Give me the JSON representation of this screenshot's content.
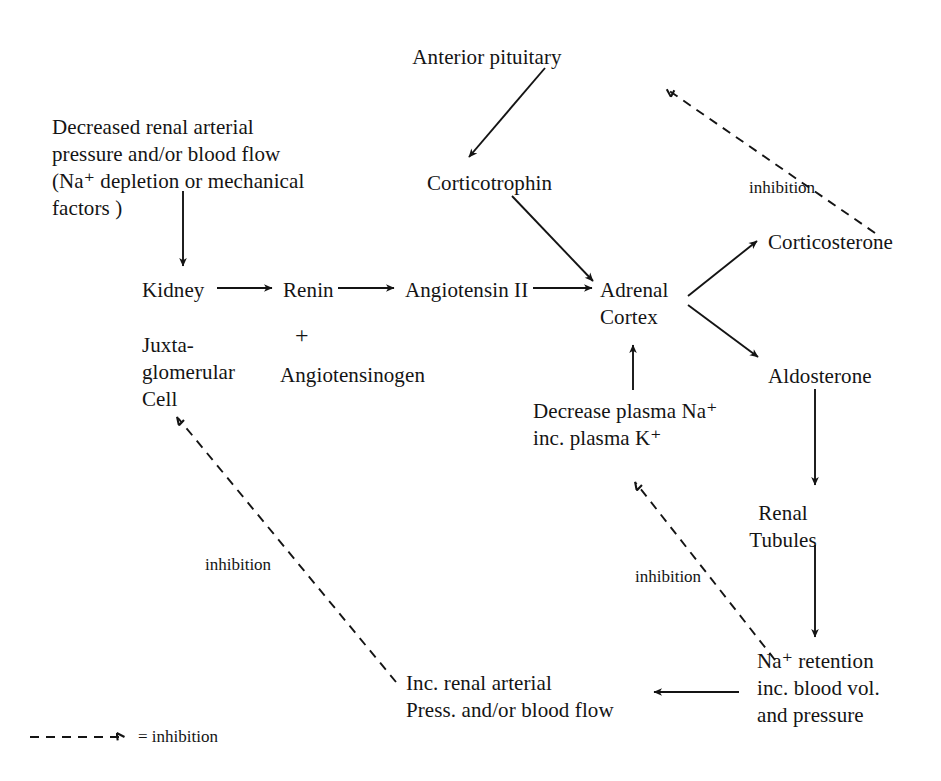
{
  "diagram": {
    "title_present": false,
    "background_color": "#ffffff",
    "line_color": "#141414",
    "nodes": [
      {
        "id": "anterior_pituitary",
        "label": "Anterior pituitary",
        "x": 487,
        "y": 44,
        "align": "center"
      },
      {
        "id": "corticotrophin",
        "label": "Corticotrophin",
        "x": 427,
        "y": 170,
        "align": "left"
      },
      {
        "id": "decreased_renal",
        "label": "Decreased renal arterial\npressure and/or blood flow\n(Na⁺ depletion or mechanical\nfactors )",
        "x": 52,
        "y": 114,
        "align": "left"
      },
      {
        "id": "kidney",
        "label": "Kidney",
        "x": 142,
        "y": 277,
        "align": "left"
      },
      {
        "id": "renin",
        "label": "Renin",
        "x": 283,
        "y": 277,
        "align": "left"
      },
      {
        "id": "angiotensin_ii",
        "label": "Angiotensin II",
        "x": 405,
        "y": 277,
        "align": "left"
      },
      {
        "id": "adrenal_cortex",
        "label": "Adrenal\nCortex",
        "x": 600,
        "y": 277,
        "align": "left"
      },
      {
        "id": "juxtaglomerular_cell",
        "label": "Juxta-\nglomerular\nCell",
        "x": 142,
        "y": 332,
        "align": "left"
      },
      {
        "id": "angiotensinogen",
        "label": "Angiotensinogen",
        "x": 280,
        "y": 362,
        "align": "left"
      },
      {
        "id": "plus_sign",
        "label": "+",
        "x": 295,
        "y": 326
      },
      {
        "id": "corticosterone",
        "label": "Corticosterone",
        "x": 768,
        "y": 229,
        "align": "left"
      },
      {
        "id": "aldosterone",
        "label": "Aldosterone",
        "x": 768,
        "y": 363,
        "align": "left"
      },
      {
        "id": "decrease_plasma",
        "label": "Decrease plasma Na⁺\ninc. plasma K⁺",
        "x": 533,
        "y": 398,
        "align": "left"
      },
      {
        "id": "renal_tubules",
        "label": "Renal\nTubules",
        "x": 783,
        "y": 500,
        "align": "center"
      },
      {
        "id": "na_retention",
        "label": "Na⁺ retention\ninc. blood vol.\nand pressure",
        "x": 757,
        "y": 648,
        "align": "left"
      },
      {
        "id": "inc_renal_arterial",
        "label": "Inc. renal arterial\nPress. and/or blood flow",
        "x": 406,
        "y": 670,
        "align": "left"
      }
    ],
    "edge_labels": [
      {
        "id": "inhibition_top_right",
        "label": "inhibition",
        "x": 749,
        "y": 178
      },
      {
        "id": "inhibition_left",
        "label": "inhibition",
        "x": 205,
        "y": 555
      },
      {
        "id": "inhibition_middle",
        "label": "inhibition",
        "x": 635,
        "y": 567
      }
    ],
    "legend": {
      "symbol": "dashed-arrow",
      "text": "= inhibition",
      "x": 30,
      "y": 731
    },
    "edges": [
      {
        "from": "anterior_pituitary",
        "to": "corticotrophin",
        "style": "solid"
      },
      {
        "from": "corticotrophin",
        "to": "adrenal_cortex",
        "style": "solid"
      },
      {
        "from": "decreased_renal",
        "to": "kidney",
        "style": "solid"
      },
      {
        "from": "kidney",
        "to": "renin",
        "style": "solid"
      },
      {
        "from": "renin",
        "to": "angiotensin_ii",
        "style": "solid"
      },
      {
        "from": "angiotensin_ii",
        "to": "adrenal_cortex",
        "style": "solid"
      },
      {
        "from": "adrenal_cortex",
        "to": "corticosterone",
        "style": "solid"
      },
      {
        "from": "adrenal_cortex",
        "to": "aldosterone",
        "style": "solid"
      },
      {
        "from": "decrease_plasma",
        "to": "adrenal_cortex",
        "style": "solid"
      },
      {
        "from": "aldosterone",
        "to": "renal_tubules",
        "style": "solid"
      },
      {
        "from": "renal_tubules",
        "to": "na_retention",
        "style": "solid"
      },
      {
        "from": "na_retention",
        "to": "inc_renal_arterial",
        "style": "solid"
      },
      {
        "from": "corticosterone",
        "to": "anterior_pituitary",
        "style": "dashed",
        "label": "inhibition"
      },
      {
        "from": "na_retention",
        "to": "decrease_plasma",
        "style": "dashed",
        "label": "inhibition"
      },
      {
        "from": "inc_renal_arterial",
        "to": "juxtaglomerular_cell",
        "style": "dashed",
        "label": "inhibition"
      }
    ]
  }
}
